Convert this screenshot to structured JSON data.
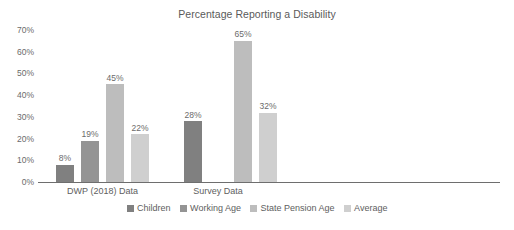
{
  "chart_data": {
    "type": "bar",
    "title": "Percentage Reporting a Disability",
    "xlabel": "",
    "ylabel": "",
    "ylim": [
      0,
      70
    ],
    "ytick_labels": [
      "0%",
      "10%",
      "20%",
      "30%",
      "40%",
      "50%",
      "60%",
      "70%"
    ],
    "ytick_values": [
      0,
      10,
      20,
      30,
      40,
      50,
      60,
      70
    ],
    "grid": false,
    "legend_position": "bottom",
    "categories": [
      "DWP (2018) Data",
      "Survey Data"
    ],
    "series": [
      {
        "name": "Children",
        "color": "#808080",
        "values": [
          8,
          28
        ]
      },
      {
        "name": "Working Age",
        "color": "#949494",
        "values": [
          19,
          null
        ]
      },
      {
        "name": "State Pension Age",
        "color": "#bdbdbd",
        "values": [
          45,
          65
        ]
      },
      {
        "name": "Average",
        "color": "#cfcfcf",
        "values": [
          22,
          32
        ]
      }
    ],
    "data_labels": {
      "DWP (2018) Data": [
        "8%",
        "19%",
        "45%",
        "22%"
      ],
      "Survey Data": [
        "28%",
        null,
        "65%",
        "32%"
      ]
    }
  },
  "legend": {
    "items": [
      {
        "label": "Children"
      },
      {
        "label": "Working Age"
      },
      {
        "label": "State Pension Age"
      },
      {
        "label": "Average"
      }
    ]
  },
  "colors": {
    "axis_line": "#6e6e6e",
    "text": "#5e5e5e",
    "background": "#ffffff"
  }
}
